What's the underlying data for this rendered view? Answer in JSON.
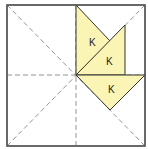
{
  "diagram": {
    "colors": {
      "border": "#555555",
      "fold_line": "#888888",
      "fill": "#FAF5B4",
      "shape_stroke": "#333333",
      "label": "#222222"
    },
    "square": {
      "x": 7,
      "y": 5,
      "width": 138,
      "height": 141
    },
    "center": {
      "x": 76,
      "y": 75
    },
    "fold_lines": [
      {
        "name": "vertical-fold",
        "x1": 76,
        "y1": 5,
        "x2": 76,
        "y2": 146
      },
      {
        "name": "horizontal-fold",
        "x1": 7,
        "y1": 75,
        "x2": 145,
        "y2": 75
      },
      {
        "name": "diagonal-fold-main",
        "x1": 7,
        "y1": 5,
        "x2": 145,
        "y2": 146
      },
      {
        "name": "diagonal-fold-anti",
        "x1": 145,
        "y1": 5,
        "x2": 7,
        "y2": 146
      }
    ],
    "pieces": [
      {
        "name": "piece-k-1",
        "label": "K",
        "points": "76,5 110,41 76,75",
        "label_pos": {
          "x": 89,
          "y": 46
        }
      },
      {
        "name": "piece-k-2",
        "label": "K",
        "points": "76,75 125,25 125,75",
        "label_pos": {
          "x": 106,
          "y": 65
        }
      },
      {
        "name": "piece-k-3",
        "label": "K",
        "points": "76,75 145,75 110,110",
        "label_pos": {
          "x": 108,
          "y": 93
        }
      }
    ]
  }
}
